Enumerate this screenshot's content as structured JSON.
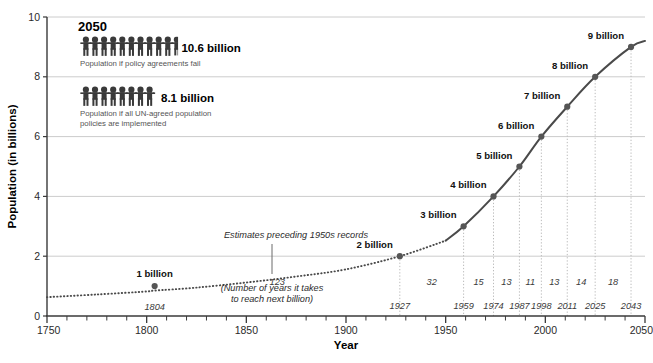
{
  "chart_data": {
    "type": "line",
    "title": "",
    "xlabel": "Year",
    "ylabel": "Population (in billions)",
    "xlim": [
      1750,
      2050
    ],
    "ylim": [
      0,
      10
    ],
    "xticks": [
      1750,
      1800,
      1850,
      1900,
      1950,
      2000,
      2050
    ],
    "yticks": [
      0,
      2,
      4,
      6,
      8,
      10
    ],
    "grid": "horizontal",
    "legend_position": "none",
    "minor_tick_interval": 10,
    "series": [
      {
        "name": "World population (estimates, pre-1950s)",
        "style": "dotted",
        "x": [
          1750,
          1775,
          1800,
          1804,
          1825,
          1850,
          1875,
          1900,
          1927,
          1950
        ],
        "values": [
          0.63,
          0.72,
          0.82,
          0.85,
          0.95,
          1.12,
          1.32,
          1.56,
          2.0,
          2.52
        ]
      },
      {
        "name": "World population (recorded, 1950s onward)",
        "style": "solid",
        "x": [
          1950,
          1959,
          1974,
          1987,
          1998,
          2011,
          2025,
          2043,
          2050
        ],
        "values": [
          2.52,
          3.0,
          4.0,
          5.0,
          6.0,
          7.0,
          8.0,
          9.0,
          9.2
        ]
      }
    ],
    "milestones": [
      {
        "label": "1 billion",
        "year": 1804,
        "value": 1.0,
        "year_label": "1804"
      },
      {
        "label": "2 billion",
        "year": 1927,
        "value": 2.0,
        "year_label": "1927"
      },
      {
        "label": "3 billion",
        "year": 1959,
        "value": 3.0,
        "year_label": "1959"
      },
      {
        "label": "4 billion",
        "year": 1974,
        "value": 4.0,
        "year_label": "1974"
      },
      {
        "label": "5 billion",
        "year": 1987,
        "value": 5.0,
        "year_label": "1987"
      },
      {
        "label": "6 billion",
        "year": 1998,
        "value": 6.0,
        "year_label": "1998"
      },
      {
        "label": "7 billion",
        "year": 2011,
        "value": 7.0,
        "year_label": "2011"
      },
      {
        "label": "8 billion",
        "year": 2025,
        "value": 8.0,
        "year_label": "2025"
      },
      {
        "label": "9 billion",
        "year": 2043,
        "value": 9.0,
        "year_label": "2043"
      }
    ],
    "gap_labels": [
      {
        "text": "123",
        "from": 1804,
        "to": 1927
      },
      {
        "text": "32",
        "from": 1927,
        "to": 1959
      },
      {
        "text": "15",
        "from": 1959,
        "to": 1974
      },
      {
        "text": "13",
        "from": 1974,
        "to": 1987
      },
      {
        "text": "11",
        "from": 1987,
        "to": 1998
      },
      {
        "text": "13",
        "from": 1998,
        "to": 2011
      },
      {
        "text": "14",
        "from": 2011,
        "to": 2025
      },
      {
        "text": "18",
        "from": 2025,
        "to": 2043
      }
    ],
    "annotations": [
      {
        "name": "estimates-note",
        "text": "Estimates preceding 1950s records"
      },
      {
        "name": "gap-legend-note-line1",
        "text": "(Number of years it takes"
      },
      {
        "name": "gap-legend-note-line2",
        "text": "to reach next billion)"
      }
    ],
    "colors": {
      "line": "#4a4a4a",
      "marker": "#555555",
      "gridline": "#cccccc",
      "axis": "#3a3a3a",
      "guideline": "#bbbbbb",
      "pictogram": "#3a3a3a",
      "caption_text": "#555555"
    }
  },
  "legend_box": {
    "year": "2050",
    "rows": [
      {
        "value": "10.6 billion",
        "caption": "Population if policy agreements fail",
        "figures_full": 10,
        "figures_partial": 0.6
      },
      {
        "value": "8.1 billion",
        "caption": "Population if all UN-agreed population policies are implemented",
        "caption_line1": "Population if all UN-agreed population",
        "caption_line2": "policies are implemented",
        "figures_full": 8,
        "figures_partial": 0.1
      }
    ]
  }
}
